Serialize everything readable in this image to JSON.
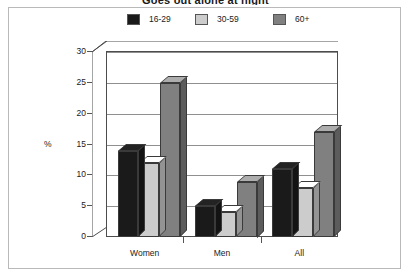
{
  "title": "Goes out alone at night",
  "legend": {
    "position": "top",
    "items": [
      {
        "label": "16-29",
        "color": "#1a1a1a"
      },
      {
        "label": "30-59",
        "color": "#cccccc"
      },
      {
        "label": "60+",
        "color": "#808080"
      }
    ]
  },
  "axis": {
    "ylabel": "%",
    "yticks": [
      "0",
      "5",
      "10",
      "15",
      "20",
      "25",
      "30"
    ],
    "xticklabels": [
      "Women",
      "Men",
      "All"
    ]
  },
  "chart_data": {
    "type": "bar",
    "title": "Goes out alone at night",
    "xlabel": "",
    "ylabel": "%",
    "ylim": [
      0,
      30
    ],
    "yticks": [
      0,
      5,
      10,
      15,
      20,
      25,
      30
    ],
    "grid": true,
    "legend_position": "top",
    "categories": [
      "Women",
      "Men",
      "All"
    ],
    "series": [
      {
        "name": "16-29",
        "color": "#1a1a1a",
        "values": [
          14,
          5,
          11
        ]
      },
      {
        "name": "30-59",
        "color": "#cccccc",
        "values": [
          12,
          4,
          8
        ]
      },
      {
        "name": "60+",
        "color": "#808080",
        "values": [
          25,
          9,
          17
        ]
      }
    ]
  }
}
